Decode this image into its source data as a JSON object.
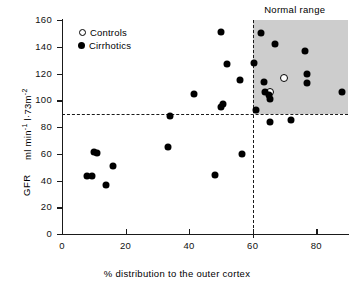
{
  "chart_data": {
    "type": "scatter",
    "title": "",
    "xlabel": "% distribution to the outer cortex",
    "ylabel_units": "ml min-1 l·73m-2",
    "ylabel_name": "GFR",
    "xlim": [
      0,
      90
    ],
    "ylim": [
      0,
      160
    ],
    "xticks": [
      0,
      20,
      40,
      60,
      80
    ],
    "yticks": [
      0,
      20,
      40,
      60,
      80,
      100,
      120,
      140,
      160
    ],
    "xtick_labels": [
      "0",
      "20",
      "40",
      "60",
      "80"
    ],
    "ytick_labels": [
      "0",
      "20",
      "40",
      "60",
      "80",
      "100",
      "120",
      "140",
      "160"
    ],
    "grid": false,
    "legend_position": "top-left-inside",
    "annotations": [
      {
        "text": "Normal range",
        "x": 74,
        "y": 166
      }
    ],
    "reference_lines": [
      {
        "orientation": "horizontal",
        "value": 90,
        "style": "dashed"
      },
      {
        "orientation": "vertical",
        "value": 60,
        "style": "dashed"
      }
    ],
    "shaded_regions": [
      {
        "label": "Normal range",
        "x_range": [
          60,
          90
        ],
        "y_range": [
          90,
          160
        ],
        "color": "#c9c9c9"
      }
    ],
    "series": [
      {
        "name": "Controls",
        "marker": "open-circle",
        "color": "#ffffff",
        "edge_color": "#000000",
        "points": [
          {
            "x": 70,
            "y": 117
          },
          {
            "x": 65.5,
            "y": 106
          }
        ]
      },
      {
        "name": "Cirrhotics",
        "marker": "filled-circle",
        "color": "#000000",
        "points": [
          {
            "x": 8,
            "y": 43
          },
          {
            "x": 9.5,
            "y": 43
          },
          {
            "x": 10,
            "y": 61
          },
          {
            "x": 11,
            "y": 60.5
          },
          {
            "x": 14,
            "y": 37
          },
          {
            "x": 16,
            "y": 51
          },
          {
            "x": 33.5,
            "y": 65
          },
          {
            "x": 34,
            "y": 88
          },
          {
            "x": 41.5,
            "y": 105
          },
          {
            "x": 48,
            "y": 44
          },
          {
            "x": 50,
            "y": 151
          },
          {
            "x": 50,
            "y": 95
          },
          {
            "x": 50.8,
            "y": 97
          },
          {
            "x": 52,
            "y": 127
          },
          {
            "x": 56,
            "y": 115.5
          },
          {
            "x": 56.5,
            "y": 59.5
          },
          {
            "x": 60.5,
            "y": 128
          },
          {
            "x": 61,
            "y": 93
          },
          {
            "x": 62.5,
            "y": 150
          },
          {
            "x": 63.5,
            "y": 114
          },
          {
            "x": 64,
            "y": 106
          },
          {
            "x": 65,
            "y": 104
          },
          {
            "x": 65.5,
            "y": 101
          },
          {
            "x": 65.5,
            "y": 84
          },
          {
            "x": 67,
            "y": 142
          },
          {
            "x": 72,
            "y": 85
          },
          {
            "x": 76.5,
            "y": 137
          },
          {
            "x": 77,
            "y": 120
          },
          {
            "x": 77,
            "y": 113
          },
          {
            "x": 88,
            "y": 106
          }
        ]
      }
    ]
  },
  "legend": {
    "items": [
      {
        "label": "Controls",
        "marker": "open-circle"
      },
      {
        "label": "Cirrhotics",
        "marker": "filled-circle"
      }
    ]
  },
  "labels": {
    "normal_range": "Normal range",
    "x_axis": "% distribution to the outer cortex",
    "y_axis_units": "ml min",
    "y_axis_units_sup1": "-1",
    "y_axis_units_mid": " l·73m",
    "y_axis_units_sup2": "-2",
    "y_axis_name": "GFR"
  }
}
